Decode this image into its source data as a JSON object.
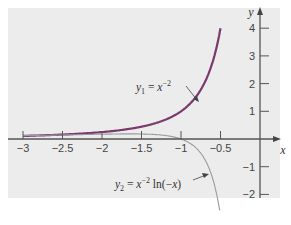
{
  "chart_data": {
    "type": "line",
    "title": "",
    "xlabel": "x",
    "ylabel": "y",
    "xlim": [
      -3.2,
      0.25
    ],
    "ylim": [
      -2.1,
      4.3
    ],
    "grid": false,
    "legend_position": "inline annotations",
    "x_ticks": [
      -3,
      -2.5,
      -2,
      -1.5,
      -1,
      -0.5
    ],
    "x_tick_labels": [
      "−3",
      "−2.5",
      "−2",
      "−1.5",
      "−1",
      "−0.5"
    ],
    "y_ticks": [
      4,
      3,
      2,
      1,
      -1,
      -2
    ],
    "y_tick_labels": [
      "4",
      "3",
      "2",
      "1",
      "−1",
      "−2"
    ],
    "series": [
      {
        "name": "y1 = x^-2",
        "label_main": "y",
        "label_sub": "1",
        "label_rest": " = x",
        "label_sup": "−2",
        "color": "#7a3a6e",
        "x_range": [
          -3,
          -0.5
        ],
        "formula": "x^-2",
        "x": [
          -3,
          -2.5,
          -2,
          -1.5,
          -1,
          -0.75,
          -0.5
        ],
        "values": [
          0.111,
          0.16,
          0.25,
          0.444,
          1.0,
          1.778,
          4.0
        ]
      },
      {
        "name": "y2 = x^-2 ln(-x)",
        "label_main": "y",
        "label_sub": "2",
        "label_rest": " = x",
        "label_sup": "−2",
        "label_tail": " ln(−x)",
        "color": "#9a9a9a",
        "x_range": [
          -3,
          -0.39
        ],
        "formula": "x^-2 * ln(-x)",
        "x": [
          -3,
          -2.5,
          -2,
          -1.5,
          -1,
          -0.75,
          -0.5,
          -0.4
        ],
        "values": [
          0.122,
          0.147,
          0.173,
          0.18,
          0.0,
          -0.511,
          -2.773,
          -5.727
        ]
      }
    ],
    "annotations": [
      {
        "text": "y1 = x^-2",
        "points_to": "series 1"
      },
      {
        "text": "y2 = x^-2 ln(-x)",
        "points_to": "series 2"
      }
    ]
  },
  "panel": {
    "background": "#ececec"
  }
}
